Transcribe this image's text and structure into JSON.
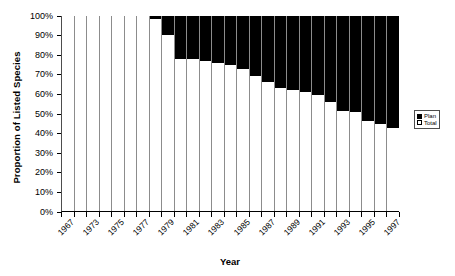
{
  "chart_data": {
    "type": "bar",
    "subtype": "stacked-100-percent",
    "title": "",
    "xlabel": "Year",
    "ylabel": "Proportion of Listed Species",
    "ylim": [
      0,
      100
    ],
    "yticks": [
      "0%",
      "10%",
      "20%",
      "30%",
      "40%",
      "50%",
      "60%",
      "70%",
      "80%",
      "90%",
      "100%"
    ],
    "ytick_values": [
      0,
      10,
      20,
      30,
      40,
      50,
      60,
      70,
      80,
      90,
      100
    ],
    "grid": false,
    "legend_position": "right",
    "categories": [
      "1967",
      "1972",
      "1973",
      "1974",
      "1975",
      "1976",
      "1977",
      "1978",
      "1979",
      "1980",
      "1981",
      "1982",
      "1983",
      "1984",
      "1985",
      "1986",
      "1987",
      "1988",
      "1989",
      "1990",
      "1991",
      "1992",
      "1993",
      "1994",
      "1995",
      "1996",
      "1997"
    ],
    "xtick_labels_visible": [
      "1967",
      "",
      "1973",
      "",
      "1975",
      "",
      "1977",
      "",
      "1979",
      "",
      "1981",
      "",
      "1983",
      "",
      "1985",
      "",
      "1987",
      "",
      "1989",
      "",
      "1991",
      "",
      "1993",
      "",
      "1995",
      "",
      "1997"
    ],
    "series": [
      {
        "name": "Total",
        "color": "#ffffff",
        "values": [
          100,
          100,
          100,
          100,
          100,
          100,
          100,
          98,
          90,
          77.5,
          77.5,
          76.5,
          75.5,
          74.5,
          72.5,
          69,
          66,
          63,
          61.5,
          60.5,
          59,
          55.5,
          51,
          50.5,
          46,
          44.5,
          42.5
        ]
      },
      {
        "name": "Plan",
        "color": "#000000",
        "values": [
          0,
          0,
          0,
          0,
          0,
          0,
          0,
          2,
          10,
          22.5,
          22.5,
          23.5,
          24.5,
          25.5,
          27.5,
          31,
          34,
          37,
          38.5,
          39.5,
          41,
          44.5,
          49,
          49.5,
          54,
          55.5,
          57.5
        ]
      }
    ],
    "legend": [
      {
        "label": "Plan",
        "swatch": "filled",
        "color": "#000000"
      },
      {
        "label": "Total",
        "swatch": "open",
        "color": "#ffffff"
      }
    ]
  }
}
